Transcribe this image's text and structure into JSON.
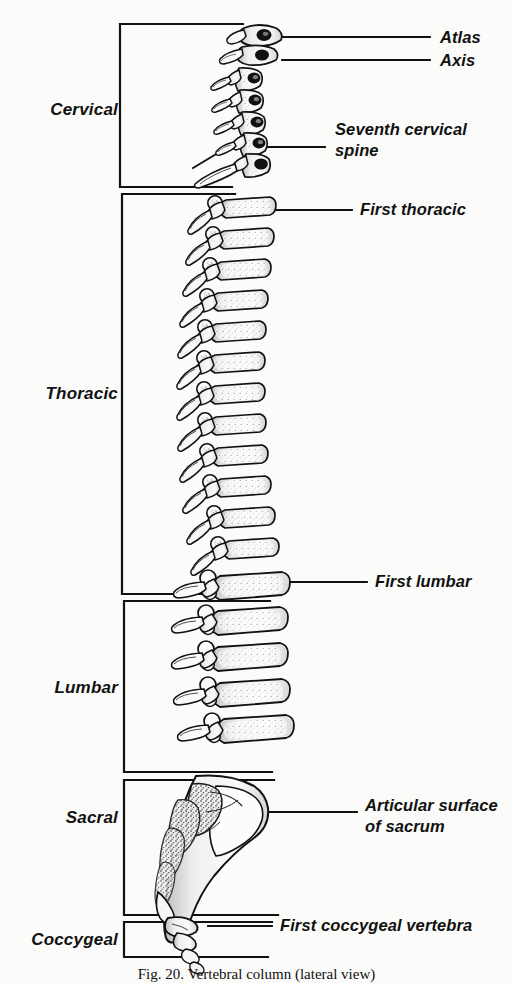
{
  "figure": {
    "title": "Vertebral column (lateral view)",
    "caption": "Fig. 20.  Vertebral column (lateral view)",
    "background_color": "#fbfbf9",
    "ink_color": "#111111",
    "view": "lateral"
  },
  "regions": [
    {
      "id": "cervical",
      "label": "Cervical",
      "bracket_top": 24,
      "bracket_bottom": 187,
      "bracket_x": 120,
      "label_x": 118,
      "label_y": 110,
      "vertebra_count": 7
    },
    {
      "id": "thoracic",
      "label": "Thoracic",
      "bracket_top": 194,
      "bracket_bottom": 594,
      "bracket_x": 122,
      "label_x": 118,
      "label_y": 394,
      "vertebra_count": 12
    },
    {
      "id": "lumbar",
      "label": "Lumbar",
      "bracket_top": 601,
      "bracket_bottom": 772,
      "bracket_x": 124,
      "label_x": 118,
      "label_y": 688,
      "vertebra_count": 5
    },
    {
      "id": "sacral",
      "label": "Sacral",
      "bracket_top": 780,
      "bracket_bottom": 915,
      "bracket_x": 124,
      "label_x": 118,
      "label_y": 818,
      "vertebra_count": 5
    },
    {
      "id": "coccygeal",
      "label": "Coccygeal",
      "bracket_top": 922,
      "bracket_bottom": 957,
      "bracket_x": 124,
      "label_x": 118,
      "label_y": 940,
      "vertebra_count": 4
    }
  ],
  "callouts": [
    {
      "id": "atlas",
      "lines": [
        "Atlas"
      ],
      "text": "Atlas",
      "label_x": 440,
      "label_y": 38,
      "leader_x1": 283,
      "leader_y1": 37,
      "leader_x2": 430,
      "leader_y2": 37
    },
    {
      "id": "axis",
      "lines": [
        "Axis"
      ],
      "text": "Axis",
      "label_x": 440,
      "label_y": 61,
      "leader_x1": 282,
      "leader_y1": 60,
      "leader_x2": 430,
      "leader_y2": 60
    },
    {
      "id": "seventh-cervical-spine",
      "lines": [
        "Seventh cervical",
        "spine"
      ],
      "text": "Seventh cervical spine",
      "label_x": 335,
      "label_y": 130,
      "leader_x1": 193,
      "leader_y1": 168,
      "leader_x2": 325,
      "leader_y2": 147
    },
    {
      "id": "first-thoracic",
      "lines": [
        "First thoracic"
      ],
      "text": "First thoracic",
      "label_x": 360,
      "label_y": 210,
      "leader_x1": 262,
      "leader_y1": 210,
      "leader_x2": 352,
      "leader_y2": 210
    },
    {
      "id": "first-lumbar",
      "lines": [
        "First lumbar"
      ],
      "text": "First lumbar",
      "label_x": 375,
      "label_y": 582,
      "leader_x1": 285,
      "leader_y1": 582,
      "leader_x2": 367,
      "leader_y2": 582
    },
    {
      "id": "articular-surface-sacrum",
      "lines": [
        "Articular surface",
        "of sacrum"
      ],
      "text": "Articular surface of sacrum",
      "label_x": 365,
      "label_y": 806,
      "leader_x1": 268,
      "leader_y1": 812,
      "leader_x2": 357,
      "leader_y2": 812
    },
    {
      "id": "first-coccygeal-vertebra",
      "lines": [
        "First coccygeal vertebra"
      ],
      "text": "First coccygeal vertebra",
      "label_x": 280,
      "label_y": 925,
      "leader_x1": 208,
      "leader_y1": 926,
      "leader_x2": 272,
      "leader_y2": 926
    }
  ]
}
